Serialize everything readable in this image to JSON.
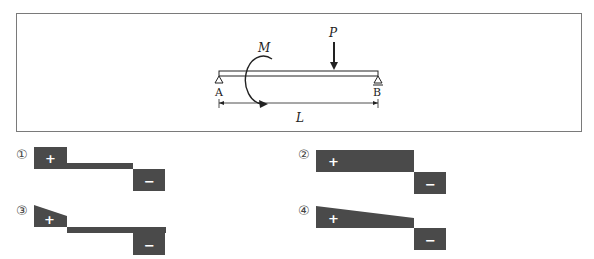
{
  "problem": {
    "beam": {
      "support_left_label": "A",
      "support_right_label": "B",
      "moment_label": "M",
      "load_label": "P",
      "length_label": "L"
    },
    "options": [
      {
        "number": "①",
        "positive_sign": "+",
        "negative_sign": "−"
      },
      {
        "number": "②",
        "positive_sign": "+",
        "negative_sign": "−"
      },
      {
        "number": "③",
        "positive_sign": "+",
        "negative_sign": "−"
      },
      {
        "number": "④",
        "positive_sign": "+",
        "negative_sign": "−"
      }
    ],
    "colors": {
      "fill": "#4a4a4a",
      "line": "#222222",
      "frame": "#7a7a7a"
    }
  }
}
